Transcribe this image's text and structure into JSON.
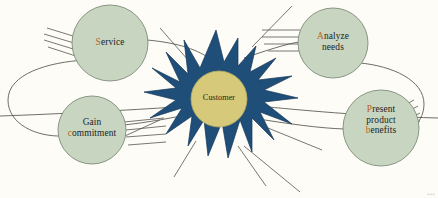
{
  "diagram": {
    "type": "radial-cycle",
    "background_color": "#fdfcf7",
    "center": {
      "label": "Customer",
      "burst_color": "#1f4e79",
      "disc_color": "#d6c97a",
      "text_color": "#1d1d18"
    },
    "node_style": {
      "fill": "#c8d5c0",
      "stroke": "#7e8b7a",
      "text_color": "#22231f",
      "highlight_color": "#b5651d"
    },
    "connector_color": "#5b5b55",
    "nodes": [
      {
        "id": "service",
        "position": "top-left",
        "lines": [
          {
            "highlight": "S",
            "rest": "ervice"
          }
        ]
      },
      {
        "id": "analyze-needs",
        "position": "top-right",
        "lines": [
          {
            "highlight": "A",
            "rest": "nalyze"
          },
          {
            "highlight": "",
            "rest": "needs"
          }
        ]
      },
      {
        "id": "gain-commitment",
        "position": "bottom-left",
        "lines": [
          {
            "highlight": "",
            "rest": "Gain"
          },
          {
            "highlight": "c",
            "rest": "ommitment"
          }
        ]
      },
      {
        "id": "present-product-benefits",
        "position": "bottom-right",
        "lines": [
          {
            "highlight": "P",
            "rest": "resent"
          },
          {
            "highlight": "",
            "rest": "product"
          },
          {
            "highlight": "b",
            "rest": "enefits"
          }
        ]
      }
    ],
    "corner_mark": "•••"
  }
}
